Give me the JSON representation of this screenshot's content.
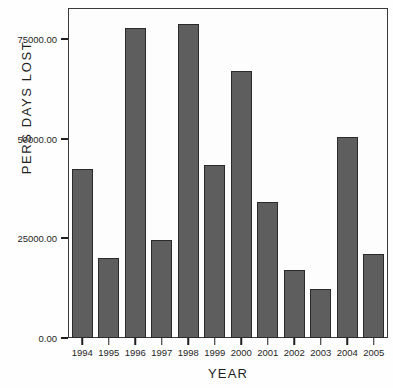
{
  "chart_data": {
    "type": "bar",
    "title": "",
    "xlabel": "YEAR",
    "ylabel": "PERS DAYS LOST",
    "categories": [
      "1994",
      "1995",
      "1996",
      "1997",
      "1998",
      "1999",
      "2000",
      "2001",
      "2002",
      "2003",
      "2004",
      "2005"
    ],
    "values": [
      42500,
      20000,
      77800,
      24500,
      78700,
      43400,
      67000,
      34000,
      17000,
      12200,
      50300,
      21000
    ],
    "ylim": [
      0,
      82500
    ],
    "yticks": [
      0,
      25000,
      50000,
      75000
    ],
    "ytick_labels": [
      "0.00",
      "25000.00",
      "50000.00",
      "75000.00"
    ],
    "grid": false,
    "legend": false,
    "bar_color": "#5e5e5e",
    "bar_edge_color": "#2a2a2a",
    "frame_color": "#3a3a3a",
    "plot_background": "#fdfdfd",
    "figure_background": "#fefefe",
    "text_color": "#1f1f1f"
  }
}
